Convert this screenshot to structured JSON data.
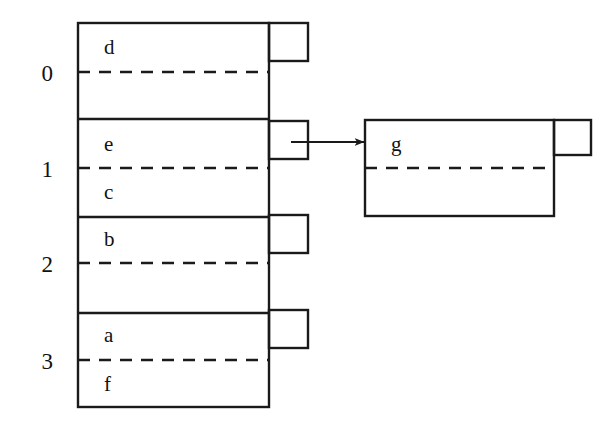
{
  "diagram": {
    "type": "bucket-table-with-overflow",
    "stroke_color": "#1a1a1a",
    "background_color": "#ffffff",
    "row_indices": [
      "0",
      "1",
      "2",
      "3"
    ],
    "buckets": [
      {
        "index": "0",
        "entries_above": "d",
        "entries_below": ""
      },
      {
        "index": "1",
        "entries_above": "e",
        "entries_below": "c"
      },
      {
        "index": "2",
        "entries_above": "b",
        "entries_below": ""
      },
      {
        "index": "3",
        "entries_above": "a",
        "entries_below": "f"
      }
    ],
    "overflow_bucket": {
      "entries_above": "g",
      "entries_below": ""
    },
    "arrow": {
      "from_bucket_index": "1",
      "to": "overflow-bucket"
    }
  },
  "geometry": {
    "main_table": {
      "x": 78,
      "y": 23,
      "w": 191,
      "h": 384
    },
    "row_dividers_y": [
      119,
      217,
      313
    ],
    "dashed_lines_y": [
      72,
      168,
      263,
      360
    ],
    "tabs": [
      {
        "x": 269,
        "y": 23,
        "w": 39,
        "h": 38
      },
      {
        "x": 269,
        "y": 121,
        "w": 39,
        "h": 38
      },
      {
        "x": 269,
        "y": 215,
        "w": 39,
        "h": 38
      },
      {
        "x": 269,
        "y": 310,
        "w": 39,
        "h": 38
      }
    ],
    "overflow_box": {
      "x": 365,
      "y": 120,
      "w": 189,
      "h": 96
    },
    "overflow_tab": {
      "x": 554,
      "y": 120,
      "w": 37,
      "h": 35
    },
    "overflow_dashed_y": 168,
    "arrow": {
      "x1": 293,
      "y1": 142,
      "x2": 365,
      "y2": 142
    },
    "index_labels": [
      {
        "text": "0",
        "x": 29,
        "y": 62
      },
      {
        "text": "1",
        "x": 29,
        "y": 158
      },
      {
        "text": "2",
        "x": 29,
        "y": 253
      },
      {
        "text": "3",
        "x": 29,
        "y": 350
      }
    ],
    "cell_labels": [
      {
        "text": "d",
        "x": 104,
        "y": 37
      },
      {
        "text": "e",
        "x": 104,
        "y": 134
      },
      {
        "text": "c",
        "x": 104,
        "y": 182
      },
      {
        "text": "b",
        "x": 104,
        "y": 229
      },
      {
        "text": "a",
        "x": 104,
        "y": 325
      },
      {
        "text": "f",
        "x": 104,
        "y": 374
      },
      {
        "text": "g",
        "x": 391,
        "y": 134
      }
    ]
  }
}
